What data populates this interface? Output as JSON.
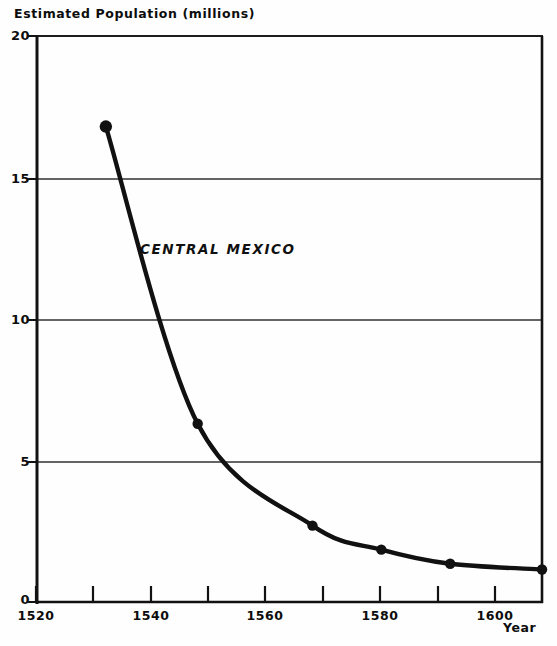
{
  "chart_data": {
    "type": "line",
    "title": "",
    "ylabel": "Estimated Population (millions)",
    "xlabel": "Year",
    "xlim": [
      1520,
      1608
    ],
    "ylim": [
      0,
      20
    ],
    "grid": true,
    "legend_position": "inline-annotation",
    "annotations": [
      {
        "text": "CENTRAL MEXICO",
        "x": 1538,
        "y": 12.4
      }
    ],
    "y_ticks": [
      "20",
      "15",
      "10",
      "5",
      "0"
    ],
    "y_tick_values": [
      20,
      15,
      10,
      5,
      0
    ],
    "x_ticks": [
      "1520",
      "1540",
      "1560",
      "1580",
      "1600"
    ],
    "x_tick_values": [
      1520,
      1540,
      1560,
      1580,
      1600
    ],
    "x_minor_tick_values": [
      1530,
      1540,
      1550,
      1560,
      1570,
      1580,
      1590,
      1600
    ],
    "series": [
      {
        "name": "CENTRAL MEXICO",
        "x": [
          1532,
          1548,
          1568,
          1580,
          1592,
          1608
        ],
        "values": [
          16.8,
          6.3,
          2.7,
          1.85,
          1.35,
          1.15
        ],
        "color": "#111111",
        "marker": "circle",
        "linewidth": 4
      }
    ]
  },
  "axis": {
    "y_title": "Estimated Population (millions)",
    "x_title": "Year",
    "y_labels": [
      "20",
      "15",
      "10",
      "5",
      "0"
    ],
    "x_labels": [
      "1520",
      "1540",
      "1560",
      "1580",
      "1600"
    ]
  },
  "annotation": {
    "series_label": "CENTRAL MEXICO"
  },
  "colors": {
    "ink": "#111111",
    "grid": "#2a2a2a",
    "background": "#fefefe"
  }
}
